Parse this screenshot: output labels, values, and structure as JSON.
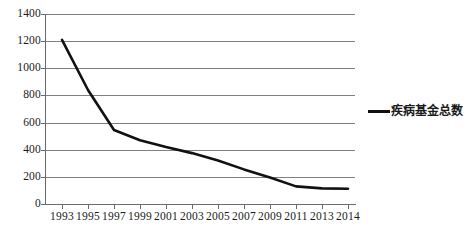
{
  "chart_data": {
    "type": "line",
    "title": "",
    "xlabel": "",
    "ylabel": "",
    "ylim": [
      0,
      1400
    ],
    "ytick_step": 200,
    "grid": true,
    "legend_position": "right",
    "line_color": "#111111",
    "gridline_color": "#808080",
    "axis_color": "#6a6a6a",
    "categories": [
      "1993",
      "1995",
      "1997",
      "1999",
      "2001",
      "2003",
      "2005",
      "2007",
      "2009",
      "2011",
      "2013",
      "2014"
    ],
    "ytick_labels": [
      "1400",
      "1200",
      "1000",
      "800",
      "600",
      "400",
      "200",
      "0"
    ],
    "series": [
      {
        "name": "疾病基金总数",
        "values": [
          1210,
          840,
          545,
          470,
          420,
          375,
          320,
          255,
          195,
          130,
          115,
          112
        ]
      }
    ]
  },
  "legend": {
    "entries": [
      {
        "label": "疾病基金总数",
        "color": "#111111"
      }
    ]
  }
}
